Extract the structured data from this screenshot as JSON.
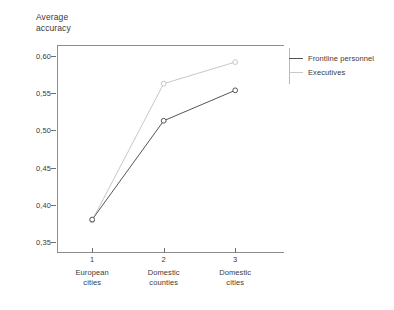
{
  "chart_data": {
    "type": "line",
    "title": "",
    "ylabel": "Average\naccuracy",
    "xlabel": "",
    "grid": false,
    "legend_position": "right",
    "x": [
      1,
      2,
      3
    ],
    "categories": [
      "European\ncities",
      "Domestic\ncounties",
      "Domestic\ncities"
    ],
    "xtick_labels": [
      "1",
      "2",
      "3"
    ],
    "ylim": [
      0.335,
      0.615
    ],
    "yticks": [
      0.35,
      0.4,
      0.45,
      0.5,
      0.55,
      0.6
    ],
    "ytick_labels": [
      "0,35",
      "0,40",
      "0,45",
      "0,50",
      "0,55",
      "0,60"
    ],
    "series": [
      {
        "name": "Frontline personnel",
        "color": "#555555",
        "values": [
          0.38,
          0.513,
          0.554
        ]
      },
      {
        "name": "Executives",
        "color": "#c8c8c8",
        "values": [
          0.379,
          0.563,
          0.592
        ]
      }
    ]
  },
  "legend": {
    "items": [
      {
        "label": "Frontline personnel",
        "color": "#555555"
      },
      {
        "label": "Executives",
        "color": "#c8c8c8"
      }
    ]
  }
}
